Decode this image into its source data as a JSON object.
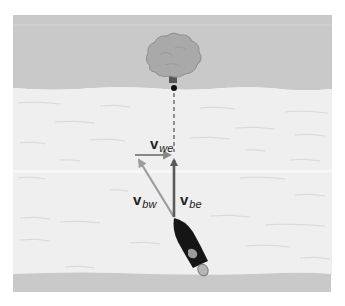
{
  "figure": {
    "labels": {
      "v_we": {
        "base": "v",
        "sub": "we"
      },
      "v_bw": {
        "base": "v",
        "sub": "bw"
      },
      "v_be": {
        "base": "v",
        "sub": "be"
      }
    },
    "colors": {
      "background": "#ffffff",
      "bank": "#c9c9c9",
      "water": "#efefef",
      "water_lines": "#d6d6d6",
      "tree_crown": "#a9a9a9",
      "tree_trunk": "#555555",
      "vector_dark": "#5a5a5a",
      "vector_light": "#9c9c9c",
      "boat_hull": "#151515",
      "motor": "#b5b5b5"
    }
  }
}
